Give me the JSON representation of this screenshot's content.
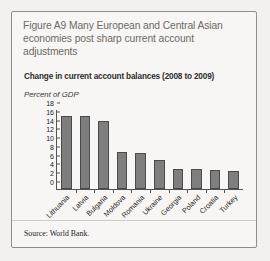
{
  "figure": {
    "title": "Figure A9  Many European and Central Asian economies post sharp current account adjustments",
    "subtitle": "Change in current account balances (2008 to 2009)",
    "source": "Source: World Bank.",
    "border_color": "#8d8d8d",
    "title_color": "#6e6a63",
    "bar_color": "#7e7e7e",
    "bar_edge_color": "#4a4a4a"
  },
  "chart_data": {
    "type": "bar",
    "title": "Change in current account balances (2008 to 2009)",
    "xlabel": "",
    "ylabel": "Percent of GDP",
    "ylim": [
      0,
      18
    ],
    "yticks": [
      0,
      2,
      4,
      6,
      8,
      10,
      12,
      14,
      16,
      18
    ],
    "ytick_labels": [
      "0",
      "2",
      "4",
      "6",
      "8",
      "10",
      "12",
      "14",
      "16",
      "18"
    ],
    "grid": false,
    "legend": false,
    "categories": [
      "Lithuania",
      "Latvia",
      "Bulgaria",
      "Moldova",
      "Romania",
      "Ukraine",
      "Georgia",
      "Poland",
      "Croatia",
      "Turkey"
    ],
    "values": [
      16.7,
      16.6,
      15.6,
      8.4,
      8.3,
      6.6,
      4.6,
      4.6,
      4.4,
      4.1
    ]
  }
}
